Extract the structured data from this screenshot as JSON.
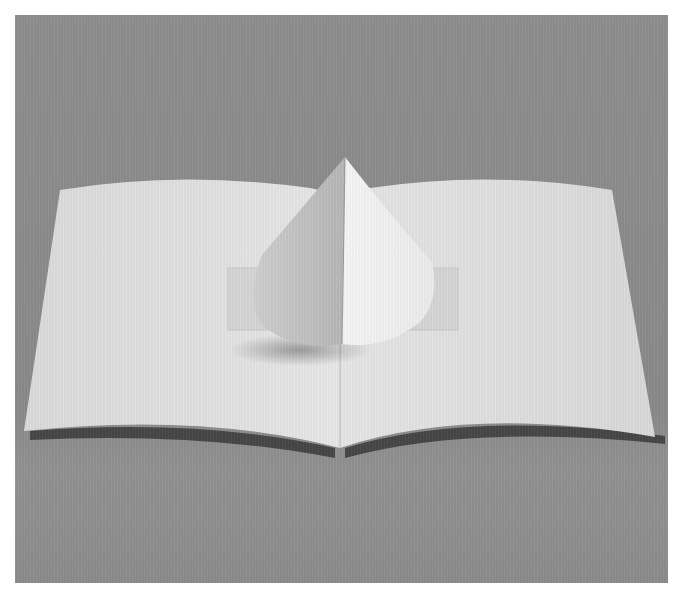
{
  "image": {
    "subject": "Pop-up paper card with a white cone rising from the center fold",
    "colors": {
      "background_gray": "#8c8c8c",
      "paper_light": "#e4e4e4",
      "paper_shadow": "#c8c8c8",
      "cone_lit": "#f4f4f4",
      "cone_shaded": "#bdbdbd",
      "cast_shadow": "#3c3c3c"
    }
  }
}
